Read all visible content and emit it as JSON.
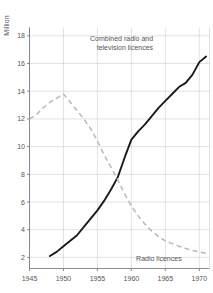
{
  "chart_data": {
    "type": "line",
    "title": "",
    "xlabel": "",
    "ylabel": "Million",
    "xlim": [
      1945,
      1971.5
    ],
    "ylim": [
      1.2,
      18.6
    ],
    "grid": true,
    "legend_position": "inline-annotations",
    "xticks": [
      "1945",
      "1950",
      "1955",
      "1960",
      "1965",
      "1970"
    ],
    "xtick_values": [
      1945,
      1950,
      1955,
      1960,
      1965,
      1970
    ],
    "yticks": [
      "2",
      "4",
      "6",
      "8",
      "10",
      "12",
      "14",
      "16",
      "18"
    ],
    "ytick_values": [
      2,
      4,
      6,
      8,
      10,
      12,
      14,
      16,
      18
    ],
    "annotations": [
      {
        "name": "combined-series-label",
        "line1": "Combined radio and",
        "line2": "television licences",
        "x": 1963.2,
        "y": 17.6
      },
      {
        "name": "radio-series-label",
        "line1": "Radio licences",
        "line2": "",
        "x": 1967.4,
        "y": 1.75
      }
    ],
    "series": [
      {
        "name": "Combined radio and television licences",
        "style": "solid",
        "color": "#1a1a1a",
        "x": [
          1948.0,
          1949.0,
          1950.0,
          1951.0,
          1952.0,
          1953.0,
          1954.0,
          1955.0,
          1956.0,
          1957.0,
          1958.0,
          1959.0,
          1960.0,
          1961.0,
          1962.0,
          1963.0,
          1964.0,
          1965.0,
          1966.0,
          1967.0,
          1968.0,
          1969.0,
          1970.0,
          1971.0
        ],
        "values": [
          2.1,
          2.4,
          2.8,
          3.2,
          3.6,
          4.2,
          4.8,
          5.4,
          6.1,
          6.9,
          7.8,
          9.2,
          10.5,
          11.1,
          11.6,
          12.2,
          12.8,
          13.3,
          13.8,
          14.3,
          14.6,
          15.2,
          16.1,
          16.5
        ]
      },
      {
        "name": "Radio licences",
        "style": "dashed",
        "color": "#b9b9b9",
        "x": [
          1945.0,
          1946.0,
          1947.0,
          1948.0,
          1949.0,
          1950.0,
          1951.0,
          1952.0,
          1953.0,
          1954.0,
          1955.0,
          1956.0,
          1957.0,
          1958.0,
          1959.0,
          1960.0,
          1961.0,
          1962.0,
          1963.0,
          1964.0,
          1965.0,
          1966.0,
          1967.0,
          1968.0,
          1969.0,
          1970.0,
          1971.0
        ],
        "values": [
          12.0,
          12.3,
          12.8,
          13.2,
          13.5,
          13.8,
          13.2,
          12.6,
          12.0,
          11.3,
          10.4,
          9.4,
          8.5,
          7.6,
          6.6,
          5.7,
          5.0,
          4.4,
          3.9,
          3.5,
          3.2,
          3.0,
          2.8,
          2.65,
          2.5,
          2.4,
          2.3
        ]
      }
    ]
  }
}
